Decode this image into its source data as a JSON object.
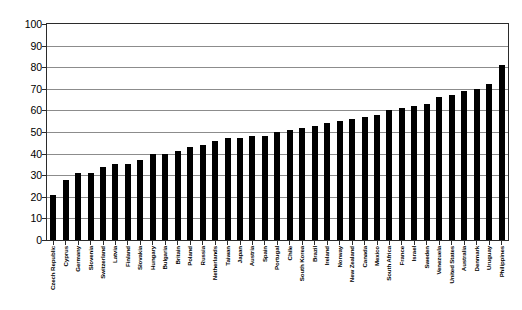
{
  "chart_data": {
    "type": "bar",
    "title": "",
    "subtitle": "",
    "xlabel": "",
    "ylabel": "",
    "ylim": [
      0,
      100
    ],
    "ytick_interval": 10,
    "ytick_labels": [
      "100",
      "90",
      "80",
      "70",
      "60",
      "50",
      "40",
      "30",
      "20",
      "10",
      "0"
    ],
    "grid": true,
    "legend": false,
    "legend_position": "none",
    "bar_color": "#000000",
    "plot_background": "#ffffff",
    "gridline_color": "#8c8c8c",
    "axis_color": "#2b2b2b",
    "categories": [
      "Czech Republic",
      "Cyprus",
      "Germany",
      "Slovenia",
      "Switzerland",
      "Latvia",
      "Finland",
      "Slovakia",
      "Hungary",
      "Bulgaria",
      "Britain",
      "Poland",
      "Russia",
      "Netherlands",
      "Taiwan",
      "Japan",
      "Austria",
      "Spain",
      "Portugal",
      "Chile",
      "South Korea",
      "Brazil",
      "Ireland",
      "Norway",
      "New Zealand",
      "Canada",
      "Mexico",
      "South Africa",
      "France",
      "Israel",
      "Sweden",
      "Venezuela",
      "United States",
      "Australia",
      "Denmark",
      "Uruguay",
      "Philippines"
    ],
    "values": [
      21,
      28,
      31,
      31,
      34,
      35,
      35,
      37,
      40,
      40,
      41,
      43,
      44,
      46,
      47,
      47,
      48,
      48,
      50,
      51,
      52,
      53,
      54,
      55,
      56,
      57,
      58,
      60,
      61,
      62,
      63,
      66,
      67,
      69,
      70,
      72,
      81
    ]
  }
}
